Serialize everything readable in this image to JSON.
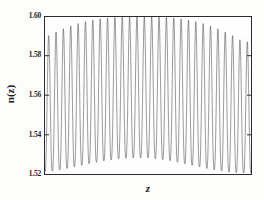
{
  "chart_data": {
    "type": "line",
    "title": "",
    "subtitle": "",
    "xlabel": "z",
    "ylabel": "n(z)",
    "grid": false,
    "legend": null,
    "xlim": [
      0,
      28
    ],
    "ylim": [
      1.52,
      1.6
    ],
    "xticks": [],
    "xticklabels": [],
    "yticks": [
      1.52,
      1.54,
      1.56,
      1.58,
      1.6
    ],
    "yticklabels": [
      "1.52",
      "1.54",
      "1.56",
      "1.58",
      "1.60"
    ],
    "n_cycles": 28,
    "series": [
      {
        "name": "n(z)",
        "color": "#4a4a4a",
        "linewidth": 0.55,
        "envelope_upper": [
          1.5895,
          1.5915,
          1.5932,
          1.5948,
          1.5961,
          1.5972,
          1.5981,
          1.5988,
          1.5993,
          1.5997,
          1.5999,
          1.6,
          1.6,
          1.6,
          1.6,
          1.6,
          1.5999,
          1.5997,
          1.5993,
          1.5988,
          1.5981,
          1.5972,
          1.5961,
          1.5948,
          1.5932,
          1.5915,
          1.5895,
          1.5873
        ],
        "envelope_lower": [
          1.521,
          1.5215,
          1.5221,
          1.5228,
          1.5236,
          1.5244,
          1.5252,
          1.5259,
          1.5266,
          1.5272,
          1.5277,
          1.528,
          1.5282,
          1.5282,
          1.5281,
          1.5278,
          1.5273,
          1.5267,
          1.526,
          1.5252,
          1.5244,
          1.5236,
          1.5228,
          1.5221,
          1.5215,
          1.521,
          1.5207,
          1.5205
        ],
        "peaks_y": [
          1.5895,
          1.5915,
          1.5932,
          1.5948,
          1.5961,
          1.5972,
          1.5981,
          1.5988,
          1.5993,
          1.5997,
          1.5999,
          1.6,
          1.6,
          1.6,
          1.6,
          1.6,
          1.5999,
          1.5997,
          1.5993,
          1.5988,
          1.5981,
          1.5972,
          1.5961,
          1.5948,
          1.5932,
          1.5915,
          1.5895,
          1.5873
        ],
        "troughs_y": [
          1.521,
          1.5215,
          1.5221,
          1.5228,
          1.5236,
          1.5244,
          1.5252,
          1.5259,
          1.5266,
          1.5272,
          1.5277,
          1.528,
          1.5282,
          1.5282,
          1.5281,
          1.5278,
          1.5273,
          1.5267,
          1.526,
          1.5252,
          1.5244,
          1.5236,
          1.5228,
          1.5221,
          1.5215,
          1.521,
          1.5207,
          1.5205
        ]
      }
    ],
    "colors": {
      "line": "#4a4a4a",
      "axis": "#2b2b2b",
      "text": "#1d1d1d",
      "background": "#ffffff"
    }
  }
}
